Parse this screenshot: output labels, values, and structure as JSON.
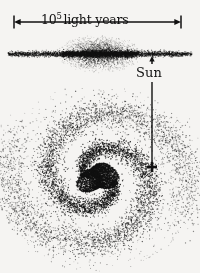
{
  "figure": {
    "background_color": "#f5f4f2",
    "ink_color": "#111111",
    "width": 200,
    "height": 273
  },
  "scale_bar": {
    "mantissa": "10",
    "exponent": "5",
    "unit": "light years",
    "full_text": "10^5 light years",
    "left_x": 14,
    "right_x": 181,
    "y": 22,
    "arrow_style": "double-headed-with-end-ticks"
  },
  "sun_marker": {
    "label": "Sun",
    "label_x": 136,
    "label_y": 66,
    "upper_arrow": {
      "tip_x": 152,
      "tip_y": 56,
      "tail_y": 64,
      "points_to": "edge-on-disk"
    },
    "lower_line": {
      "x": 152,
      "from_y": 82,
      "to_y": 167
    },
    "cross": {
      "x": 152,
      "y": 167,
      "arm_length": 5,
      "thickness": 2.6
    }
  },
  "edge_on_view": {
    "name": "edge-on-galaxy-profile",
    "center_x": 100,
    "center_y": 54,
    "disk_half_length": 92,
    "disk_half_thickness": 1.9,
    "bulge_radius_x": 30,
    "bulge_radius_y": 13,
    "dot_count": 5200
  },
  "face_on_view": {
    "name": "face-on-spiral-galaxy",
    "center_x": 100,
    "center_y": 178,
    "core_radius": 17,
    "core_dot_count": 2600,
    "arm_count": 2,
    "arm_turns": 1.08,
    "arm_dot_count": 5200,
    "halo_dot_count": 520,
    "max_radius": 96
  },
  "chart_data": {
    "type": "scatter",
    "annotations": [
      "10^5 light years",
      "Sun"
    ],
    "xlabel": "",
    "ylabel": ""
  }
}
